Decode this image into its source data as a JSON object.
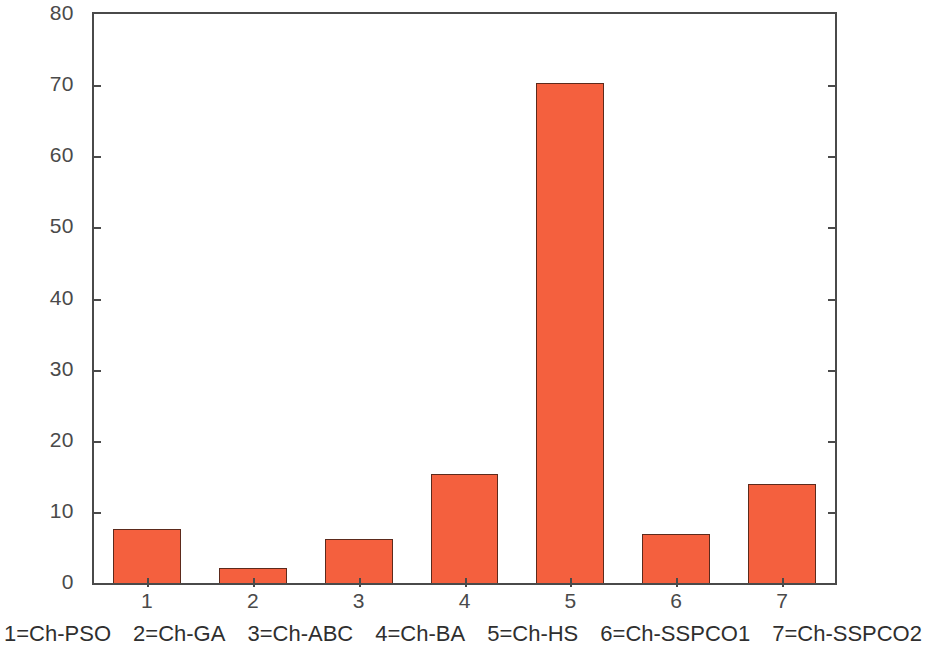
{
  "chart_data": {
    "type": "bar",
    "title": "",
    "xlabel": "",
    "ylabel": "",
    "categories": [
      "1",
      "2",
      "3",
      "4",
      "5",
      "6",
      "7"
    ],
    "values": [
      7.6,
      2.1,
      6.2,
      15.3,
      70.3,
      6.9,
      13.9
    ],
    "ylim": [
      0,
      80
    ],
    "ytick_values": [
      0,
      10,
      20,
      30,
      40,
      50,
      60,
      70,
      80
    ],
    "ytick_labels": [
      "0",
      "10",
      "20",
      "30",
      "40",
      "50",
      "60",
      "70",
      "80"
    ],
    "xtick_labels": [
      "1",
      "2",
      "3",
      "4",
      "5",
      "6",
      "7"
    ],
    "grid": false,
    "legend_position": "below-axes",
    "series": [
      {
        "name": "Ch",
        "values": [
          7.6,
          2.1,
          6.2,
          15.3,
          70.3,
          6.9,
          13.9
        ]
      }
    ],
    "category_names": [
      "Ch-PSO",
      "Ch-GA",
      "Ch-ABC",
      "Ch-BA",
      "Ch-HS",
      "Ch-SSPCO1",
      "Ch-SSPCO2"
    ],
    "annotations": [],
    "colors": {
      "bar_fill": "#f4603e",
      "bar_edge": "#5c2a1c",
      "axis": "#4a4a4a",
      "text": "#3a3a3a",
      "background": "#ffffff"
    }
  },
  "caption": {
    "items": [
      "1=Ch-PSO",
      "2=Ch-GA",
      "3=Ch-ABC",
      "4=Ch-BA",
      "5=Ch-HS",
      "6=Ch-SSPCO1",
      "7=Ch-SSPCO2"
    ]
  }
}
